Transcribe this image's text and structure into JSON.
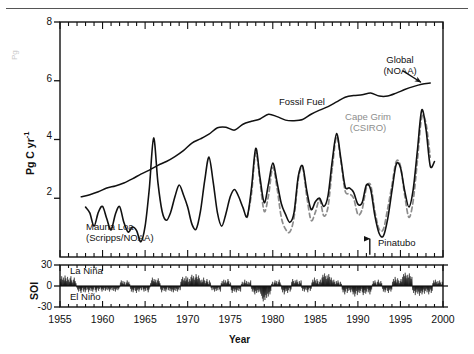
{
  "figure": {
    "ghost_label": "Pg",
    "year_axis_label": "Year",
    "main_y_label": "Pg C yr",
    "main_y_label_sup": "-1",
    "soi_y_label": "SOI"
  },
  "annotations": {
    "fossil_fuel": "Fossil Fuel",
    "mauna_loa_l1": "Mauna Loa",
    "mauna_loa_l2": "(Scripps/NOAA)",
    "global_l1": "Global",
    "global_l2": "(NOAA)",
    "cape_grim_l1": "Cape Grim",
    "cape_grim_l2": "(CSIRO)",
    "pinatubo": "Pinatubo",
    "la_nina": "La Niña",
    "el_nino": "El Niño"
  },
  "colors": {
    "axis": "#111111",
    "fossil_fuel": "#111111",
    "mauna_loa": "#111111",
    "cape_grim": "#8d8d8d",
    "soi_fill": "#111111",
    "page_rule": "#555555"
  },
  "chart_data": {
    "type": "line",
    "title": "",
    "xlabel": "Year",
    "ylabel": "Pg C yr-1",
    "xlim": [
      1955,
      2000
    ],
    "ylim": [
      0,
      8
    ],
    "yticks": [
      2,
      4,
      6,
      8
    ],
    "xticks": [
      1955,
      1960,
      1965,
      1970,
      1975,
      1980,
      1985,
      1990,
      1995,
      2000
    ],
    "xminor_step": 1,
    "grid": false,
    "legend": "annotations-inline",
    "series": [
      {
        "name": "Fossil Fuel",
        "style": "solid-black",
        "x": [
          1957.5,
          1958.5,
          1959.5,
          1960.5,
          1961.5,
          1962.5,
          1963.5,
          1964.5,
          1965.5,
          1966.5,
          1967.5,
          1968.5,
          1969.5,
          1970.5,
          1971.5,
          1972.5,
          1973.5,
          1974.5,
          1975.5,
          1976.5,
          1977.5,
          1978.5,
          1979.5,
          1980.5,
          1981.5,
          1982.5,
          1983.5,
          1984.5,
          1985.5,
          1986.5,
          1987.5,
          1988.5,
          1989.5,
          1990.5,
          1991.5,
          1992.5,
          1993.5,
          1994.5,
          1995.5,
          1996.5,
          1997.5,
          1998.5
        ],
        "y": [
          2.05,
          2.12,
          2.22,
          2.35,
          2.42,
          2.52,
          2.66,
          2.82,
          2.96,
          3.12,
          3.25,
          3.42,
          3.62,
          3.88,
          4.02,
          4.18,
          4.4,
          4.42,
          4.32,
          4.52,
          4.62,
          4.7,
          4.86,
          4.78,
          4.66,
          4.64,
          4.68,
          4.86,
          5.0,
          5.12,
          5.28,
          5.44,
          5.5,
          5.52,
          5.58,
          5.48,
          5.48,
          5.58,
          5.7,
          5.8,
          5.88,
          5.92
        ]
      },
      {
        "name": "Mauna Loa (Scripps/NOAA)",
        "style": "solid-black",
        "x": [
          1958.0,
          1958.5,
          1959.0,
          1959.5,
          1960.0,
          1960.5,
          1961.0,
          1961.5,
          1962.0,
          1962.5,
          1963.0,
          1963.5,
          1964.0,
          1964.5,
          1965.0,
          1965.5,
          1966.0,
          1966.5,
          1967.0,
          1967.5,
          1968.0,
          1968.5,
          1969.0,
          1969.5,
          1970.0,
          1970.5,
          1971.0,
          1971.5,
          1972.0,
          1972.5,
          1973.0,
          1973.5,
          1974.0,
          1974.5,
          1975.0,
          1975.5,
          1976.0,
          1976.5,
          1977.0,
          1977.5,
          1978.0,
          1978.5,
          1979.0,
          1979.5,
          1980.0,
          1980.5,
          1981.0,
          1981.5,
          1982.0,
          1982.5,
          1983.0,
          1983.5,
          1984.0,
          1984.5,
          1985.0,
          1985.5,
          1986.0,
          1986.5,
          1987.0,
          1987.5,
          1988.0,
          1988.5,
          1989.0,
          1989.5,
          1990.0,
          1990.5,
          1991.0,
          1991.5,
          1992.0,
          1992.5,
          1993.0,
          1993.5,
          1994.0,
          1994.5,
          1995.0,
          1995.5,
          1996.0,
          1996.5,
          1997.0,
          1997.5,
          1998.0,
          1998.5,
          1999.0
        ],
        "y": [
          1.7,
          1.5,
          1.05,
          1.52,
          1.72,
          1.3,
          0.92,
          1.45,
          1.72,
          1.18,
          0.85,
          1.02,
          0.9,
          0.52,
          1.05,
          2.35,
          4.05,
          2.55,
          1.55,
          1.25,
          1.52,
          2.05,
          2.45,
          2.12,
          1.7,
          1.12,
          0.95,
          1.55,
          2.6,
          3.4,
          2.55,
          1.5,
          1.05,
          1.48,
          2.05,
          2.3,
          2.05,
          1.68,
          1.38,
          2.35,
          3.7,
          2.7,
          1.85,
          2.5,
          3.2,
          2.55,
          1.82,
          1.45,
          1.18,
          1.52,
          2.75,
          3.1,
          2.25,
          1.62,
          1.88,
          2.0,
          1.72,
          2.1,
          3.3,
          4.2,
          3.35,
          2.4,
          2.35,
          2.2,
          1.8,
          1.85,
          2.45,
          2.3,
          1.4,
          0.8,
          0.72,
          1.3,
          2.25,
          3.15,
          3.05,
          2.25,
          1.7,
          2.3,
          3.65,
          5.0,
          4.35,
          3.1,
          3.25
        ]
      },
      {
        "name": "Cape Grim (CSIRO)",
        "style": "dashed-gray",
        "x": [
          1977.0,
          1977.5,
          1978.0,
          1978.5,
          1979.0,
          1979.5,
          1980.0,
          1980.5,
          1981.0,
          1981.5,
          1982.0,
          1982.5,
          1983.0,
          1983.5,
          1984.0,
          1984.5,
          1985.0,
          1985.5,
          1986.0,
          1986.5,
          1987.0,
          1987.5,
          1988.0,
          1988.5,
          1989.0,
          1989.5,
          1990.0,
          1990.5,
          1991.0,
          1991.5,
          1992.0,
          1992.5,
          1993.0,
          1993.5,
          1994.0,
          1994.5,
          1995.0,
          1995.5,
          1996.0,
          1996.5,
          1997.0,
          1997.5,
          1998.0,
          1998.5
        ],
        "y": [
          1.35,
          2.15,
          3.55,
          2.55,
          1.55,
          2.1,
          3.05,
          2.35,
          1.35,
          0.95,
          0.85,
          1.35,
          2.65,
          3.05,
          2.05,
          1.25,
          1.52,
          1.95,
          1.4,
          1.72,
          3.05,
          4.1,
          3.25,
          2.25,
          2.15,
          2.0,
          1.45,
          1.62,
          2.35,
          2.45,
          1.55,
          0.95,
          0.95,
          1.65,
          2.45,
          3.25,
          3.1,
          2.1,
          1.35,
          1.92,
          3.3,
          4.75,
          4.55,
          3.4
        ]
      }
    ],
    "inline_labels": [
      {
        "text": "Fossil Fuel",
        "x": 1983.5,
        "y": 4.95
      },
      {
        "text": "Mauna Loa (Scripps/NOAA)",
        "x": 1962.5,
        "y": 0.62
      },
      {
        "text": "Global (NOAA)",
        "x": 1993.6,
        "y": 6.55,
        "arrow_to_x": 1997.4,
        "arrow_to_y": 5.95
      },
      {
        "text": "Cape Grim (CSIRO)",
        "x": 1992.5,
        "y": 4.45,
        "color": "#8d8d8d"
      },
      {
        "text": "Pinatubo",
        "x": 1992.3,
        "y": 0.28,
        "arrow": "down",
        "arrow_x": 1991.4
      }
    ]
  },
  "soi_data": {
    "type": "area",
    "ylabel": "SOI",
    "ylim": [
      -30,
      30
    ],
    "yticks": [
      -30,
      0,
      30
    ],
    "xlim": [
      1955,
      2000
    ],
    "baseline": 0,
    "labels": {
      "positive": "La Niña",
      "negative": "El Niño"
    },
    "monthly_values": [
      6,
      10,
      14,
      9,
      12,
      8,
      15,
      11,
      7,
      13,
      9,
      6,
      11,
      14,
      8,
      5,
      9,
      12,
      7,
      4,
      -2,
      -5,
      -8,
      -4,
      -7,
      -10,
      -6,
      -3,
      -8,
      -5,
      -9,
      -6,
      -2,
      -5,
      -9,
      -6,
      -3,
      -7,
      -4,
      -8,
      -5,
      -2,
      -6,
      -9,
      -5,
      -3,
      -7,
      -4,
      -2,
      -5,
      -8,
      -4,
      -6,
      -3,
      -7,
      -5,
      -2,
      -6,
      -4,
      -8,
      -5,
      -3,
      -6,
      -2,
      -7,
      -4,
      -8,
      -5,
      -3,
      -6,
      -4,
      -2,
      5,
      8,
      4,
      7,
      3,
      6,
      2,
      5,
      8,
      4,
      6,
      3,
      -4,
      -8,
      -5,
      -9,
      -6,
      -3,
      -7,
      -10,
      -6,
      -4,
      -8,
      -5,
      -3,
      -6,
      -2,
      -5,
      -8,
      -4,
      -7,
      -3,
      -6,
      -9,
      -5,
      -2,
      4,
      8,
      12,
      7,
      10,
      6,
      9,
      5,
      8,
      11,
      7,
      4,
      -5,
      -9,
      -6,
      -3,
      -7,
      -4,
      -8,
      -5,
      -2,
      -6,
      -3,
      -7,
      -4,
      -8,
      -5,
      -9,
      -6,
      -3,
      -7,
      -4,
      -8,
      -5,
      -2,
      -6,
      6,
      10,
      13,
      8,
      11,
      7,
      14,
      9,
      12,
      6,
      10,
      7,
      13,
      16,
      11,
      14,
      9,
      12,
      17,
      13,
      10,
      15,
      11,
      8,
      5,
      9,
      6,
      12,
      8,
      4,
      7,
      10,
      6,
      3,
      8,
      5,
      -3,
      -6,
      -2,
      -5,
      -8,
      -4,
      -7,
      -3,
      -6,
      -2,
      -5,
      -8,
      4,
      7,
      3,
      9,
      5,
      8,
      4,
      6,
      10,
      7,
      3,
      5,
      -6,
      -10,
      -7,
      -4,
      -8,
      -5,
      -9,
      -6,
      -3,
      -7,
      -4,
      -8,
      3,
      6,
      2,
      5,
      9,
      4,
      7,
      3,
      6,
      2,
      5,
      8,
      -4,
      -8,
      -5,
      -9,
      -12,
      -7,
      -10,
      -6,
      -9,
      -5,
      -8,
      -11,
      -14,
      -18,
      -22,
      -16,
      -20,
      -13,
      -17,
      -11,
      -15,
      -9,
      -12,
      -7,
      3,
      6,
      2,
      5,
      8,
      4,
      7,
      3,
      6,
      9,
      5,
      2,
      -5,
      -9,
      -6,
      -12,
      -8,
      -4,
      -7,
      -10,
      -6,
      -3,
      -8,
      -5,
      6,
      10,
      7,
      4,
      8,
      5,
      9,
      6,
      3,
      7,
      4,
      8,
      -3,
      -7,
      -4,
      -8,
      -5,
      -2,
      -6,
      -9,
      -5,
      -3,
      -7,
      -4,
      5,
      9,
      6,
      12,
      8,
      4,
      10,
      7,
      3,
      6,
      9,
      5,
      12,
      16,
      13,
      18,
      14,
      10,
      15,
      11,
      17,
      13,
      9,
      12,
      8,
      5,
      9,
      6,
      3,
      7,
      4,
      8,
      5,
      2,
      6,
      3,
      -5,
      -9,
      -6,
      -12,
      -8,
      -4,
      -10,
      -7,
      -3,
      -6,
      -9,
      -5,
      -8,
      -12,
      -9,
      -15,
      -11,
      -7,
      -13,
      -9,
      -6,
      -10,
      -7,
      -4,
      -9,
      -13,
      -10,
      -6,
      -11,
      -8,
      -4,
      -9,
      -6,
      -12,
      -8,
      -5,
      3,
      7,
      4,
      8,
      5,
      2,
      6,
      9,
      5,
      3,
      7,
      4,
      -4,
      -8,
      -5,
      -9,
      -6,
      -3,
      -7,
      -10,
      -6,
      -4,
      -8,
      -5,
      6,
      10,
      7,
      13,
      9,
      5,
      11,
      8,
      4,
      7,
      10,
      6,
      13,
      17,
      14,
      19,
      15,
      11,
      16,
      12,
      18,
      14,
      10,
      13,
      -6,
      -10,
      -7,
      -13,
      -9,
      -5,
      -11,
      -8,
      -14,
      -10,
      -7,
      -12,
      -9,
      -5,
      -11,
      -7,
      -4,
      -9,
      -6,
      -12,
      -8,
      -5,
      -10,
      -7,
      4,
      8,
      5,
      9,
      6,
      3,
      7,
      4,
      8,
      5,
      2,
      6
    ]
  }
}
